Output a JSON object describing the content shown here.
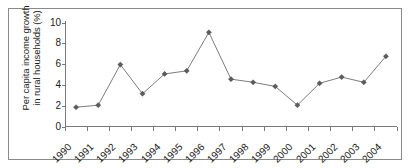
{
  "chart_data": {
    "type": "line",
    "title": "",
    "xlabel": "",
    "ylabel": "Per capita income growth in rural households (%)",
    "ylabel_line1": "Per capita income growth",
    "ylabel_line2": "in rural households (%)",
    "categories": [
      "1990",
      "1991",
      "1992",
      "1993",
      "1994",
      "1995",
      "1996",
      "1997",
      "1998",
      "1999",
      "2000",
      "2001",
      "2002",
      "2003",
      "2004"
    ],
    "values": [
      1.9,
      2.1,
      6.0,
      3.2,
      5.1,
      5.4,
      9.1,
      4.6,
      4.3,
      3.9,
      2.1,
      4.2,
      4.8,
      4.3,
      6.8
    ],
    "ylim": [
      0,
      10
    ],
    "yticks": [
      0,
      2,
      4,
      6,
      8,
      10
    ],
    "ytick_labels": [
      "0",
      "2",
      "4",
      "6",
      "8",
      "10"
    ],
    "grid": false,
    "legend": false,
    "marker": "diamond",
    "line_color": "#7d7d7d",
    "marker_color": "#5c5c5c",
    "axis_color": "#7a7a7a",
    "border_color": "#8a8a8a",
    "background_color": "#ffffff",
    "text_color": "#1a1a1a"
  }
}
